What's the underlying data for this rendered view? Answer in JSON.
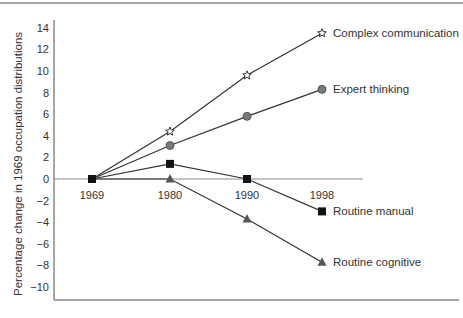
{
  "chart_data": {
    "type": "line",
    "title": "",
    "xlabel": "",
    "ylabel": "Percentage change in 1969 occupation distributions",
    "x": [
      "1969",
      "1980",
      "1990",
      "1998"
    ],
    "ylim": [
      -11,
      15
    ],
    "yticks": [
      14,
      12,
      10,
      8,
      6,
      4,
      2,
      0,
      -2,
      -4,
      -6,
      -8,
      -10
    ],
    "ytick_labels": [
      "14",
      "12",
      "10",
      "8",
      "6",
      "4",
      "2",
      "0",
      "−2",
      "−4",
      "−6",
      "−8",
      "−10"
    ],
    "grid": false,
    "legend_position": "inline-right",
    "series": [
      {
        "name": "Complex communication",
        "marker": "star",
        "values": [
          0,
          4.4,
          9.6,
          13.5
        ]
      },
      {
        "name": "Expert thinking",
        "marker": "circle",
        "values": [
          0,
          3.1,
          5.8,
          8.3
        ]
      },
      {
        "name": "Routine manual",
        "marker": "square",
        "values": [
          0,
          1.4,
          0,
          -3.0
        ]
      },
      {
        "name": "Routine cognitive",
        "marker": "triangle",
        "values": [
          0,
          0,
          -3.7,
          -7.7
        ]
      }
    ]
  },
  "colors": {
    "line": "#333333",
    "circle_fill": "#7a7a7a",
    "square_fill": "#111111",
    "triangle_fill": "#555555",
    "frame": "#888888"
  }
}
